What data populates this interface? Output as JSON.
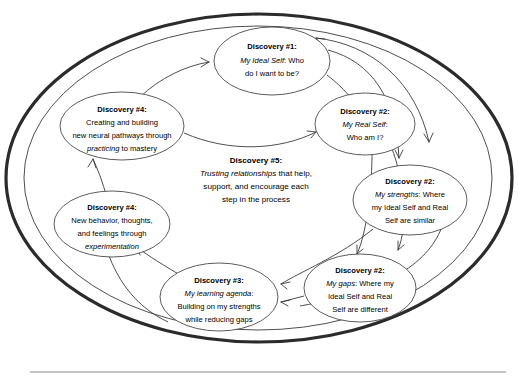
{
  "diagram": {
    "type": "cycle-diagram",
    "colors": {
      "outer_ring": "#2b2b2b",
      "inner_ring": "#3a3a3a",
      "node_stroke": "#4a4a4a",
      "arrow": "#3b3b3b",
      "text": "#000000",
      "background": "#ffffff",
      "rule": "#8a8a8a"
    },
    "nodes": [
      {
        "id": "discovery-1",
        "title": "Discovery #1:",
        "lines": [
          {
            "emphasis": "My Ideal Self",
            "rest": ": Who"
          },
          {
            "emphasis": "",
            "rest": "do I want to be?"
          }
        ],
        "cx": 272,
        "cy": 61,
        "rx": 58,
        "ry": 34
      },
      {
        "id": "discovery-2-real-self",
        "title": "Discovery #2:",
        "lines": [
          {
            "emphasis": "My Real Self",
            "rest": ":"
          },
          {
            "emphasis": "",
            "rest": "Who am I?"
          }
        ],
        "cx": 365,
        "cy": 124,
        "rx": 50,
        "ry": 31
      },
      {
        "id": "discovery-2-strengths",
        "title": "Discovery #2:",
        "lines": [
          {
            "emphasis": "My strengths",
            "rest": ": Where"
          },
          {
            "emphasis": "",
            "rest": "my Ideal Self and Real"
          },
          {
            "emphasis": "",
            "rest": "Self are similar"
          }
        ],
        "cx": 410,
        "cy": 200,
        "rx": 57,
        "ry": 35
      },
      {
        "id": "discovery-2-gaps",
        "title": "Discovery #2:",
        "lines": [
          {
            "emphasis": "My gaps",
            "rest": ": Where my"
          },
          {
            "emphasis": "",
            "rest": "Ideal Self and Real"
          },
          {
            "emphasis": "",
            "rest": "Self are different"
          }
        ],
        "cx": 360,
        "cy": 288,
        "rx": 56,
        "ry": 34
      },
      {
        "id": "discovery-3",
        "title": "Discovery #3:",
        "lines": [
          {
            "emphasis": "My learning agenda",
            "rest": ":"
          },
          {
            "emphasis": "",
            "rest": "Building on my strengths"
          },
          {
            "emphasis": "",
            "rest": "while reducing gaps"
          }
        ],
        "cx": 219,
        "cy": 297,
        "rx": 59,
        "ry": 34
      },
      {
        "id": "discovery-4-experimentation",
        "title": "Discovery #4:",
        "lines": [
          {
            "emphasis": "",
            "rest": "New behavior, thoughts,"
          },
          {
            "emphasis": "",
            "rest": "and feelings through"
          },
          {
            "emphasis": "experimentation",
            "rest": ""
          }
        ],
        "cx": 112,
        "cy": 224,
        "rx": 58,
        "ry": 33
      },
      {
        "id": "discovery-4-mastery",
        "title": "Discovery #4:",
        "lines": [
          {
            "emphasis": "",
            "rest": "Creating and building"
          },
          {
            "emphasis": "",
            "rest": "new neural pathways through"
          },
          {
            "emphasis": "practicing",
            "rest": " to mastery"
          }
        ],
        "cx": 122,
        "cy": 126,
        "rx": 62,
        "ry": 34
      }
    ],
    "center_node": {
      "id": "discovery-5",
      "title": "Discovery #5:",
      "lines": [
        {
          "emphasis": "Trusting relationships",
          "rest": " that help,"
        },
        {
          "emphasis": "",
          "rest": "support, and encourage each"
        },
        {
          "emphasis": "",
          "rest": "step in the process"
        }
      ],
      "cx": 256,
      "cy": 173
    },
    "arrows": [
      {
        "id": "arrow-mastery-to-ideal",
        "from": "discovery-4-mastery",
        "to": "discovery-1"
      },
      {
        "id": "arrow-ideal-to-real",
        "from": "discovery-1",
        "to": "discovery-2-real-self"
      },
      {
        "id": "arrow-ideal-to-strengths",
        "from": "discovery-1",
        "to": "discovery-2-strengths"
      },
      {
        "id": "arrow-ideal-to-gaps",
        "from": "discovery-1",
        "to": "discovery-2-gaps"
      },
      {
        "id": "arrow-real-to-strengths",
        "from": "discovery-2-real-self",
        "to": "discovery-2-strengths"
      },
      {
        "id": "arrow-real-to-gaps",
        "from": "discovery-2-real-self",
        "to": "discovery-2-gaps"
      },
      {
        "id": "arrow-strengths-to-learning",
        "from": "discovery-2-strengths",
        "to": "discovery-3"
      },
      {
        "id": "arrow-gaps-to-learning",
        "from": "discovery-2-gaps",
        "to": "discovery-3"
      },
      {
        "id": "arrow-learning-to-experimentation",
        "from": "discovery-3",
        "to": "discovery-4-experimentation"
      },
      {
        "id": "arrow-experimentation-to-mastery",
        "from": "discovery-4-experimentation",
        "to": "discovery-4-mastery"
      }
    ]
  }
}
